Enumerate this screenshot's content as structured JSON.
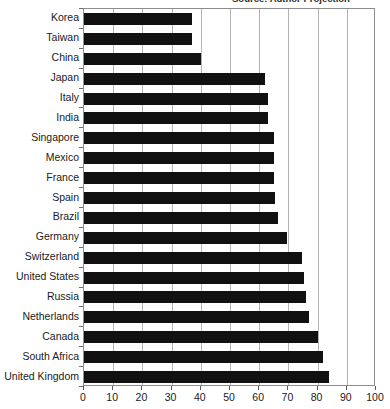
{
  "title": {
    "clipped_text": "Source: Author Projection",
    "visible": "partially clipped at top edge"
  },
  "chart_data": {
    "type": "bar",
    "orientation": "horizontal",
    "title": "",
    "xlabel": "",
    "ylabel": "",
    "xlim": [
      0,
      100
    ],
    "xticks": [
      0,
      10,
      20,
      30,
      40,
      50,
      60,
      70,
      80,
      90,
      100
    ],
    "grid": "vertical",
    "legend": "none",
    "bar_color": "#111111",
    "categories": [
      "Korea",
      "Taiwan",
      "China",
      "Japan",
      "Italy",
      "India",
      "Singapore",
      "Mexico",
      "France",
      "Spain",
      "Brazil",
      "Germany",
      "Switzerland",
      "United States",
      "Russia",
      "Netherlands",
      "Canada",
      "South Africa",
      "United Kingdom"
    ],
    "values": [
      37,
      37,
      40,
      62,
      63,
      63,
      65,
      65,
      65,
      65.5,
      66.5,
      69.5,
      74.5,
      75.5,
      76,
      77,
      80,
      82,
      84
    ]
  }
}
